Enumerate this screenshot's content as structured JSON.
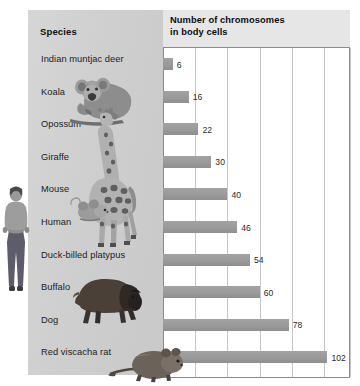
{
  "panels": {
    "species_header": "Species",
    "chart_title_line1": "Number of chromosomes",
    "chart_title_line2": "in body cells"
  },
  "colors": {
    "panel_bg": "#cfcfcf",
    "header_bg": "#e6e6e6",
    "bar_fill": "#9a9a9a",
    "gridline": "#c6c6c6",
    "plot_border": "#8c8c8c",
    "text": "#1a1a1a"
  },
  "chart_data": {
    "type": "bar",
    "orientation": "horizontal",
    "title": "Number of chromosomes in body cells",
    "xlabel": "",
    "ylabel": "Species",
    "categories": [
      "Indian muntjac deer",
      "Koala",
      "Opossum",
      "Giraffe",
      "Mouse",
      "Human",
      "Duck-billed platypus",
      "Buffalo",
      "Dog",
      "Red viscacha rat"
    ],
    "values": [
      6,
      16,
      22,
      30,
      40,
      46,
      54,
      60,
      78,
      102
    ],
    "data_labels": [
      "6",
      "16",
      "22",
      "30",
      "40",
      "46",
      "54",
      "60",
      "78",
      "102"
    ],
    "xlim": [
      0,
      116
    ],
    "gridlines_at": [
      0,
      20,
      40,
      60,
      80,
      100,
      116
    ],
    "grid": true,
    "legend": "none",
    "tick_labels_visible": false
  },
  "illustrations": [
    {
      "name": "human-photo",
      "species": "Human"
    },
    {
      "name": "koala-photo",
      "species": "Koala"
    },
    {
      "name": "giraffe-photo",
      "species": "Giraffe"
    },
    {
      "name": "mouse-photo",
      "species": "Mouse"
    },
    {
      "name": "buffalo-photo",
      "species": "Buffalo"
    },
    {
      "name": "red-viscacha-rat-photo",
      "species": "Red viscacha rat"
    }
  ]
}
